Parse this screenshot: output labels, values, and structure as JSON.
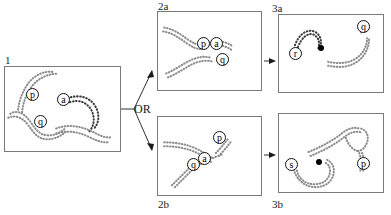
{
  "figure": {
    "width": 391,
    "height": 215,
    "background": "#ffffff",
    "line_color": "#7a7a7a",
    "strand_color": "#8d8d8d",
    "node_color": "#000000"
  },
  "connector": {
    "or_label": "OR",
    "branch_arrow_up": "arrow-up-right",
    "branch_arrow_down": "arrow-down-right",
    "step_arrow_top": "arrow-right",
    "step_arrow_bottom": "arrow-right"
  },
  "panels": [
    {
      "id": "panel-1",
      "label": "1",
      "label_position": "top-left-outside",
      "x": 4,
      "y": 66,
      "w": 117,
      "h": 86,
      "nodes": [
        {
          "name": "p",
          "x": 31,
          "y": 93
        },
        {
          "name": "a",
          "x": 62,
          "y": 98
        },
        {
          "name": "q",
          "x": 39,
          "y": 120
        }
      ],
      "dots": []
    },
    {
      "id": "panel-2a",
      "label": "2a",
      "label_position": "top-left-outside",
      "x": 157,
      "y": 11,
      "w": 105,
      "h": 80,
      "nodes": [
        {
          "name": "p",
          "x": 196,
          "y": 42
        },
        {
          "name": "a",
          "x": 209,
          "y": 42
        },
        {
          "name": "q",
          "x": 215,
          "y": 58
        }
      ],
      "dots": []
    },
    {
      "id": "panel-2b",
      "label": "2b",
      "label_position": "bottom-left-outside",
      "x": 157,
      "y": 116,
      "w": 105,
      "h": 80,
      "nodes": [
        {
          "name": "p",
          "x": 212,
          "y": 136
        },
        {
          "name": "a",
          "x": 197,
          "y": 157
        },
        {
          "name": "q",
          "x": 186,
          "y": 163
        }
      ],
      "dots": []
    },
    {
      "id": "panel-3a",
      "label": "3a",
      "label_position": "top-left-outside",
      "x": 278,
      "y": 14,
      "w": 106,
      "h": 79,
      "nodes": [
        {
          "name": "r",
          "x": 295,
          "y": 52
        },
        {
          "name": "q",
          "x": 363,
          "y": 25
        }
      ],
      "dots": [
        {
          "x": 320,
          "y": 47
        }
      ]
    },
    {
      "id": "panel-3b",
      "label": "3b",
      "label_position": "bottom-left-outside",
      "x": 278,
      "y": 113,
      "w": 106,
      "h": 80,
      "nodes": [
        {
          "name": "s",
          "x": 291,
          "y": 164
        },
        {
          "name": "p",
          "x": 363,
          "y": 163
        }
      ],
      "dots": [
        {
          "x": 318,
          "y": 161
        }
      ]
    }
  ]
}
